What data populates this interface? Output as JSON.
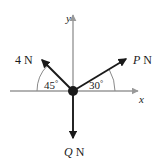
{
  "figure": {
    "background_color": "#ffffff",
    "axis_color": "#999999",
    "vector_color": "#1a1a1a",
    "arc_color": "#8a8a8a",
    "origin": {
      "x": 73,
      "y": 91,
      "dot_radius": 5
    },
    "axes": {
      "y_label": "y",
      "x_label": "x",
      "y_axis": {
        "x": 73,
        "top_y": 13,
        "bottom_y": 140
      },
      "x_axis": {
        "y": 91,
        "left_x": 10,
        "right_x": 141
      }
    },
    "forces": [
      {
        "id": "force-4n",
        "label_value": "4",
        "label_unit": "N",
        "label_text": "4 N",
        "angle_from_positive_x_deg": 135,
        "tip": {
          "x": 41,
          "y": 59
        }
      },
      {
        "id": "force-p",
        "label_value": "P",
        "label_unit": "N",
        "label_text": "P N",
        "angle_from_positive_x_deg": 30,
        "tip": {
          "x": 127,
          "y": 58
        }
      },
      {
        "id": "force-q",
        "label_value": "Q",
        "label_unit": "N",
        "label_text": "Q N",
        "angle_from_positive_x_deg": 270,
        "tip": {
          "x": 73,
          "y": 140
        }
      }
    ],
    "angles": [
      {
        "id": "angle-45",
        "value": "45",
        "degree_symbol": "°",
        "text": "45°",
        "measured_from": "negative-x-axis",
        "radius": 36
      },
      {
        "id": "angle-30",
        "value": "30",
        "degree_symbol": "°",
        "text": "30°",
        "measured_from": "positive-x-axis",
        "radius": 42
      }
    ]
  }
}
